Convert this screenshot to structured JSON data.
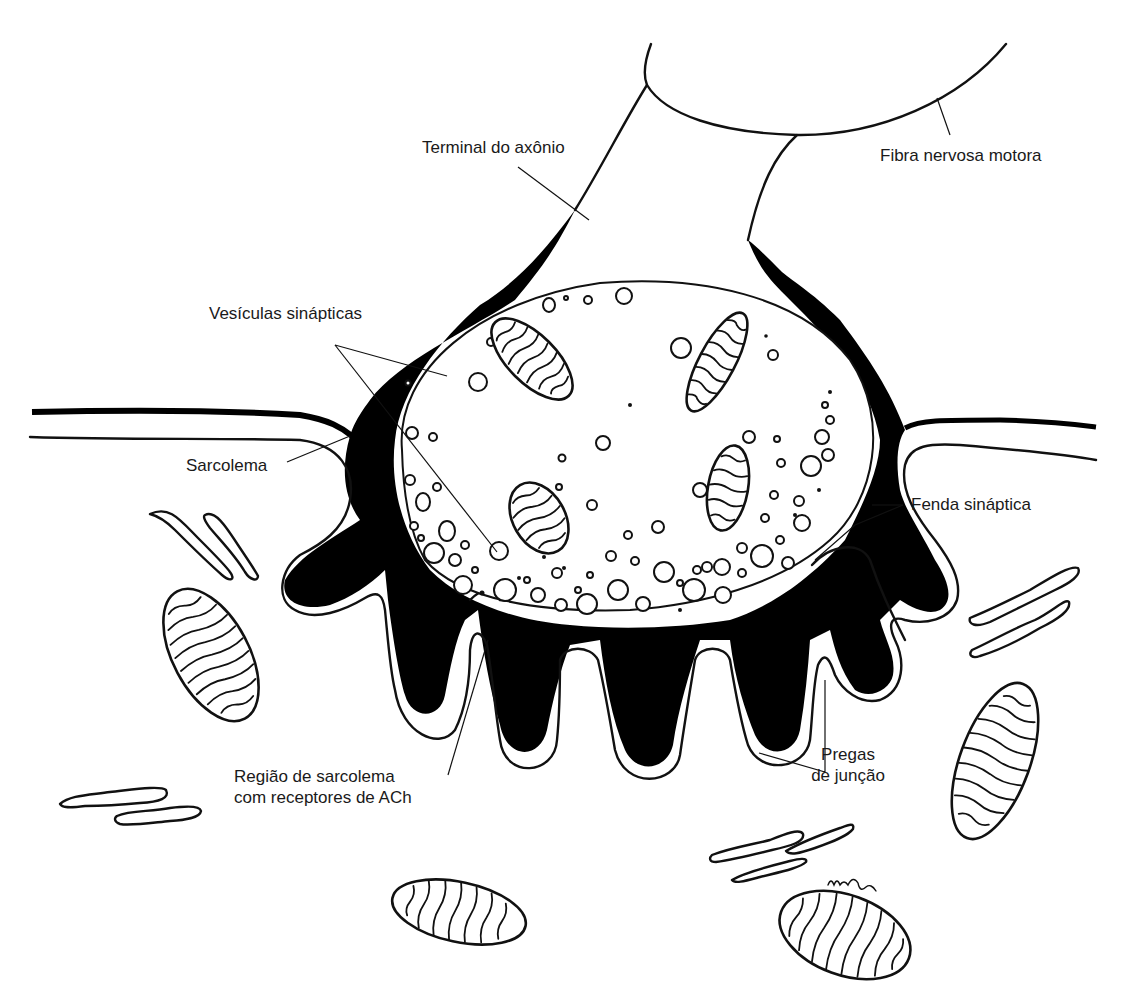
{
  "figure": {
    "labels": {
      "axon_terminal": "Terminal do axônio",
      "motor_nerve_fiber": "Fibra nervosa motora",
      "synaptic_vesicles": "Vesículas sinápticas",
      "sarcolemma": "Sarcolema",
      "synaptic_cleft": "Fenda sináptica",
      "ach_region_line1": "Região de sarcolema",
      "ach_region_line2": "com receptores de ACh",
      "junctional_folds_line1": "Pregas",
      "junctional_folds_line2": "de junção"
    },
    "colors": {
      "ink": "#111111",
      "background": "#ffffff",
      "label_text": "#1a1a1a"
    }
  }
}
